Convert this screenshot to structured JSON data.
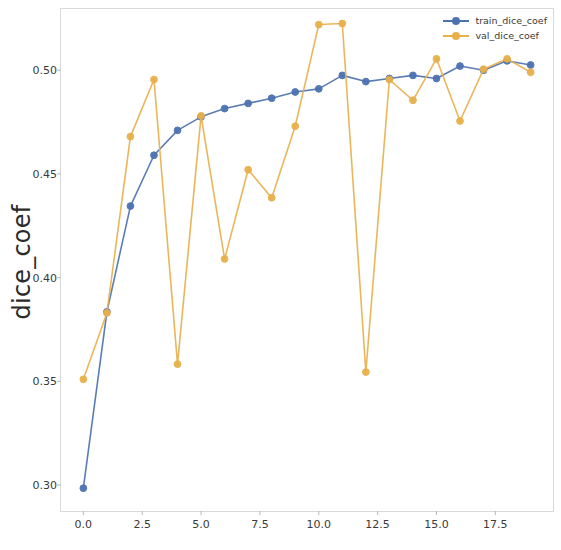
{
  "chart_data": {
    "type": "line",
    "title": "",
    "xlabel": "",
    "ylabel": "dice_coef",
    "xlim": [
      -0.95,
      19.95
    ],
    "ylim": [
      0.2875,
      0.5295
    ],
    "grid": false,
    "legend_position": "upper right",
    "xticks": [
      "0.0",
      "2.5",
      "5.0",
      "7.5",
      "10.0",
      "12.5",
      "15.0",
      "17.5"
    ],
    "xtick_values": [
      0.0,
      2.5,
      5.0,
      7.5,
      10.0,
      12.5,
      15.0,
      17.5
    ],
    "yticks": [
      "0.30",
      "0.35",
      "0.40",
      "0.45",
      "0.50"
    ],
    "ytick_values": [
      0.3,
      0.35,
      0.4,
      0.45,
      0.5
    ],
    "x": [
      0,
      1,
      2,
      3,
      4,
      5,
      6,
      7,
      8,
      9,
      10,
      11,
      12,
      13,
      14,
      15,
      16,
      17,
      18,
      19
    ],
    "series": [
      {
        "name": "train_dice_coef",
        "color": "#4c72b0",
        "marker": "circle",
        "values": [
          0.2985,
          0.3835,
          0.4345,
          0.459,
          0.471,
          0.4775,
          0.4815,
          0.484,
          0.4865,
          0.4895,
          0.491,
          0.4975,
          0.4945,
          0.496,
          0.4975,
          0.496,
          0.502,
          0.5,
          0.5045,
          0.5025
        ]
      },
      {
        "name": "val_dice_coef",
        "color": "#e8b04b",
        "marker": "circle",
        "values": [
          0.351,
          0.383,
          0.468,
          0.4955,
          0.3583,
          0.478,
          0.409,
          0.452,
          0.4385,
          0.473,
          0.522,
          0.5225,
          0.3545,
          0.4955,
          0.4855,
          0.5055,
          0.4755,
          0.5005,
          0.5055,
          0.499
        ]
      }
    ]
  },
  "legend": {
    "entries": [
      {
        "label": "train_dice_coef"
      },
      {
        "label": "val_dice_coef"
      }
    ]
  },
  "axis": {
    "y_label": "dice_coef"
  }
}
